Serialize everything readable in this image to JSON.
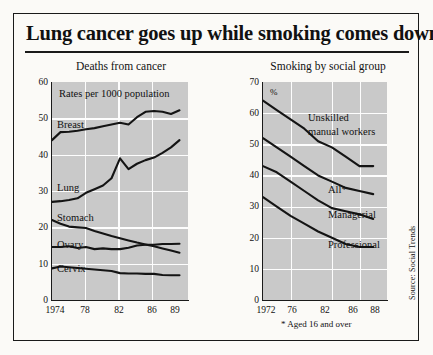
{
  "figure": {
    "title": "Lung cancer goes up while smoking comes down",
    "source": "Source: Social Trends",
    "footnote": "* Aged 16 and over"
  },
  "chart_data": [
    {
      "type": "line",
      "title": "Deaths from cancer",
      "annotation": "Rates per 1000 population",
      "xlabel": "",
      "ylabel": "",
      "ylim": [
        0,
        60
      ],
      "yticks": [
        0,
        10,
        20,
        30,
        40,
        50,
        60
      ],
      "xlim": [
        1974,
        1990
      ],
      "xticks": [
        1974,
        78,
        82,
        86,
        89
      ],
      "xtick_values": [
        1974,
        1978,
        1982,
        1986,
        1989
      ],
      "grid": true,
      "legend": "inline-labels",
      "x": [
        1974,
        1975,
        1976,
        1977,
        1978,
        1979,
        1980,
        1981,
        1982,
        1983,
        1984,
        1985,
        1986,
        1987,
        1988,
        1989
      ],
      "series": [
        {
          "name": "Breast",
          "values": [
            44.0,
            46.2,
            46.3,
            46.6,
            47.0,
            47.3,
            47.8,
            48.3,
            48.8,
            48.3,
            50.3,
            51.8,
            52.0,
            51.8,
            51.2,
            52.2
          ]
        },
        {
          "name": "Lung",
          "values": [
            27.0,
            27.2,
            27.5,
            28.0,
            29.5,
            30.5,
            31.5,
            33.5,
            39.0,
            36.0,
            37.5,
            38.5,
            39.2,
            40.5,
            42.0,
            44.0
          ]
        },
        {
          "name": "Stomach",
          "values": [
            22.0,
            21.0,
            20.2,
            20.0,
            19.8,
            19.0,
            18.3,
            17.6,
            17.0,
            16.4,
            15.8,
            15.3,
            14.8,
            14.2,
            13.6,
            13.0
          ]
        },
        {
          "name": "Ovary",
          "values": [
            14.6,
            14.6,
            14.8,
            14.3,
            14.6,
            14.0,
            14.2,
            14.0,
            14.0,
            14.4,
            15.0,
            15.2,
            15.2,
            15.4,
            15.4,
            15.5
          ]
        },
        {
          "name": "Cervix",
          "values": [
            8.7,
            9.2,
            9.0,
            8.8,
            8.6,
            8.4,
            8.2,
            8.0,
            7.4,
            7.3,
            7.3,
            7.2,
            7.2,
            6.9,
            6.8,
            6.8
          ]
        }
      ]
    },
    {
      "type": "line",
      "title": "Smoking by social group",
      "annotation": "%",
      "xlabel": "",
      "ylabel": "",
      "ylim": [
        0,
        70
      ],
      "yticks": [
        0,
        10,
        20,
        30,
        40,
        50,
        60,
        70
      ],
      "xlim": [
        1972,
        1990
      ],
      "xticks": [
        1972,
        76,
        82,
        86,
        88
      ],
      "xtick_values": [
        1972,
        1976,
        1982,
        1986,
        1988
      ],
      "grid": true,
      "legend": "inline-labels",
      "x": [
        1972,
        1974,
        1976,
        1978,
        1980,
        1982,
        1984,
        1986,
        1988
      ],
      "series": [
        {
          "name": "Unskilled manual workers",
          "values": [
            64.0,
            61.0,
            58.0,
            55.0,
            51.0,
            49.0,
            46.0,
            43.0,
            43.0
          ]
        },
        {
          "name": "All*",
          "values": [
            52.0,
            49.0,
            46.0,
            43.0,
            40.0,
            38.0,
            36.0,
            35.0,
            34.0
          ]
        },
        {
          "name": "Managerial",
          "values": [
            43.0,
            41.0,
            38.0,
            35.0,
            32.0,
            29.5,
            28.5,
            27.5,
            26.0
          ]
        },
        {
          "name": "Professional",
          "values": [
            33.0,
            30.0,
            27.0,
            24.5,
            22.0,
            20.0,
            18.0,
            17.0,
            17.0
          ]
        }
      ]
    }
  ],
  "left_chart": {
    "title": "Deaths from cancer",
    "annotation": "Rates per 1000 population",
    "yticks": [
      "60",
      "50",
      "40",
      "30",
      "20",
      "10",
      "0"
    ],
    "xticks": [
      "1974",
      "78",
      "82",
      "86",
      "89"
    ],
    "labels": {
      "breast": "Breast",
      "lung": "Lung",
      "stomach": "Stomach",
      "ovary": "Ovary",
      "cervix": "Cervix"
    }
  },
  "right_chart": {
    "title": "Smoking by social group",
    "annotation": "%",
    "yticks": [
      "70",
      "60",
      "50",
      "40",
      "30",
      "20",
      "10",
      "0"
    ],
    "xticks": [
      "1972",
      "76",
      "82",
      "86",
      "88"
    ],
    "labels": {
      "unskilled_line1": "Unskilled",
      "unskilled_line2": "manual workers",
      "all": "All*",
      "managerial": "Managerial",
      "professional": "Professional"
    }
  }
}
